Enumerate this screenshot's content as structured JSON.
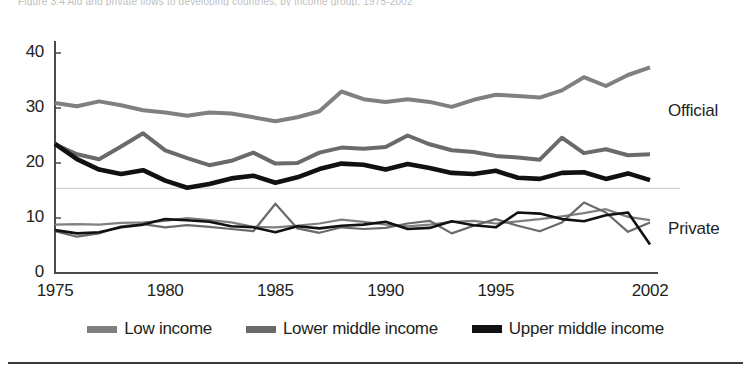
{
  "figure": {
    "clipped_title": "Figure 3.4  Aid and private flows to developing countries, by income group, 1975-2002",
    "annotations": [
      {
        "name": "official-label",
        "text": "Official",
        "x": 668,
        "y": 101
      },
      {
        "name": "private-label",
        "text": "Private",
        "x": 668,
        "y": 219
      }
    ]
  },
  "legend": {
    "position": "bottom-center",
    "items": [
      {
        "label": "Low income",
        "color": "#808080"
      },
      {
        "label": "Lower middle income",
        "color": "#6a6a6a"
      },
      {
        "label": "Upper middle income",
        "color": "#111111"
      }
    ]
  },
  "chart_data": {
    "type": "line",
    "title": "Aid and private flows to developing countries, by income group, 1975-2002",
    "xlabel": "",
    "ylabel": "",
    "xlim": [
      1975,
      2002
    ],
    "ylim": [
      0,
      40
    ],
    "yticks": [
      0,
      10,
      20,
      30,
      40
    ],
    "ytick_labels": [
      "0",
      "10",
      "20",
      "30",
      "40"
    ],
    "xticks": [
      1975,
      1980,
      1985,
      1990,
      1995,
      2002
    ],
    "xtick_labels": [
      "1975",
      "1980",
      "1985",
      "1990",
      "1995",
      "2002"
    ],
    "grid": false,
    "reference_line": {
      "y": 15.4,
      "color": "#c9c9c9"
    },
    "x": [
      1975,
      1976,
      1977,
      1978,
      1979,
      1980,
      1981,
      1982,
      1983,
      1984,
      1985,
      1986,
      1987,
      1988,
      1989,
      1990,
      1991,
      1992,
      1993,
      1994,
      1995,
      1996,
      1997,
      1998,
      1999,
      2000,
      2001,
      2002
    ],
    "groups": [
      "Official",
      "Private"
    ],
    "series": [
      {
        "name": "Low income",
        "group": "Official",
        "color": "#808080",
        "width": 4.0,
        "values": [
          30.9,
          30.3,
          31.2,
          30.5,
          29.6,
          29.2,
          28.6,
          29.2,
          29.0,
          28.3,
          27.6,
          28.3,
          29.4,
          33.0,
          31.6,
          31.1,
          31.6,
          31.1,
          30.2,
          31.5,
          32.4,
          32.2,
          31.9,
          33.2,
          35.6,
          34.0,
          36.0,
          37.4
        ]
      },
      {
        "name": "Lower middle income",
        "group": "Official",
        "color": "#6a6a6a",
        "width": 4.0,
        "values": [
          23.4,
          21.6,
          20.7,
          23.0,
          25.4,
          22.3,
          20.9,
          19.6,
          20.4,
          21.9,
          19.9,
          20.0,
          21.9,
          22.8,
          22.6,
          22.9,
          25.0,
          23.4,
          22.3,
          22.0,
          21.3,
          21.0,
          20.6,
          24.6,
          21.8,
          22.5,
          21.4,
          21.6
        ]
      },
      {
        "name": "Upper middle income",
        "group": "Official",
        "color": "#111111",
        "width": 4.6,
        "values": [
          23.5,
          20.7,
          18.8,
          18.0,
          18.7,
          16.8,
          15.5,
          16.2,
          17.2,
          17.7,
          16.4,
          17.4,
          18.9,
          19.9,
          19.7,
          18.8,
          19.8,
          19.1,
          18.2,
          18.0,
          18.6,
          17.3,
          17.1,
          18.2,
          18.3,
          17.1,
          18.1,
          16.9
        ]
      },
      {
        "name": "Low income",
        "group": "Private",
        "color": "#808080",
        "width": 2.2,
        "values": [
          8.8,
          8.9,
          8.8,
          9.1,
          9.2,
          9.5,
          10.0,
          9.6,
          9.2,
          8.4,
          8.3,
          8.6,
          9.0,
          9.7,
          9.3,
          8.8,
          8.5,
          8.8,
          9.3,
          9.5,
          9.0,
          9.4,
          9.8,
          10.3,
          10.9,
          11.6,
          10.2,
          9.6
        ]
      },
      {
        "name": "Lower middle income",
        "group": "Private",
        "color": "#6a6a6a",
        "width": 2.2,
        "values": [
          7.6,
          6.6,
          7.2,
          8.5,
          8.9,
          8.3,
          8.7,
          8.4,
          8.0,
          7.6,
          12.6,
          8.1,
          7.3,
          8.3,
          8.0,
          8.2,
          9.0,
          9.5,
          7.2,
          8.6,
          9.8,
          8.6,
          7.6,
          9.2,
          12.8,
          11.0,
          7.5,
          9.2
        ]
      },
      {
        "name": "Upper middle income",
        "group": "Private",
        "color": "#111111",
        "width": 2.6,
        "values": [
          7.8,
          7.2,
          7.4,
          8.3,
          8.8,
          9.8,
          9.6,
          9.3,
          8.5,
          8.3,
          7.4,
          8.5,
          8.1,
          8.6,
          8.8,
          9.3,
          8.0,
          8.2,
          9.4,
          8.7,
          8.3,
          11.0,
          10.8,
          9.8,
          9.4,
          10.5,
          11.0,
          5.2
        ]
      }
    ]
  }
}
